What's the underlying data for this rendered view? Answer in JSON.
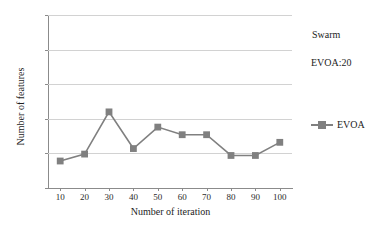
{
  "chart_data": {
    "type": "line",
    "title": "",
    "xlabel": "Number of iteration",
    "ylabel": "Number of features",
    "x": [
      10,
      20,
      30,
      40,
      50,
      60,
      70,
      80,
      90,
      100
    ],
    "categories": [
      "10",
      "20",
      "30",
      "40",
      "50",
      "60",
      "70",
      "80",
      "90",
      "100"
    ],
    "series": [
      {
        "name": "EVOA",
        "values": [
          3.9,
          4.9,
          11.0,
          5.7,
          8.8,
          7.7,
          7.7,
          4.7,
          4.7,
          6.6
        ],
        "color": "#808080",
        "marker": "square"
      }
    ],
    "xlim": [
      5,
      105
    ],
    "ylim": [
      0,
      25
    ],
    "yticks": [
      0,
      5,
      10,
      15,
      20,
      25
    ],
    "ytick_labels": [
      "0",
      "5",
      "10",
      "15",
      "20",
      "25"
    ],
    "xticks": [
      10,
      20,
      30,
      40,
      50,
      60,
      70,
      80,
      90,
      100
    ],
    "grid": "horizontal",
    "grid_color": "#d2d2d2",
    "legend_position": "right",
    "annotations": [
      "Swarm",
      "EVOA:20"
    ]
  },
  "annotations": {
    "swarm": "Swarm",
    "evoa_value": "EVOA:20"
  },
  "legend": {
    "entries": [
      {
        "label": "EVOA",
        "color": "#808080",
        "marker": "square-marker"
      }
    ]
  },
  "axes": {
    "x_title": "Number of iteration",
    "y_title": "Number of features"
  }
}
